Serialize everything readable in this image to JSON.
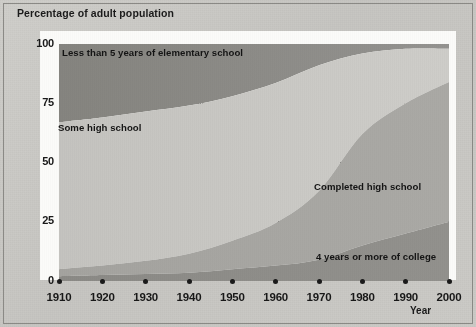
{
  "figure": {
    "y_axis_title": "Percentage of adult population",
    "x_axis_title": "Year"
  },
  "chart_data": {
    "type": "area",
    "title": "Percentage of adult population",
    "xlabel": "Year",
    "ylabel": "Percentage of adult population",
    "xlim": [
      1910,
      2000
    ],
    "ylim": [
      0,
      100
    ],
    "grid": true,
    "stacked": true,
    "legend": "inline-band-labels",
    "x": [
      1910,
      1920,
      1930,
      1940,
      1950,
      1960,
      1970,
      1980,
      1990,
      2000
    ],
    "y_ticks": [
      0,
      25,
      50,
      75,
      100
    ],
    "x_ticks": [
      1910,
      1920,
      1930,
      1940,
      1950,
      1960,
      1970,
      1980,
      1990,
      2000
    ],
    "series": [
      {
        "name": "4 years or more of college",
        "order": "bottom",
        "color": "#8e8d8a",
        "values": [
          2.0,
          2.5,
          3.0,
          3.5,
          5.0,
          6.5,
          9.0,
          15.0,
          20.0,
          25.0
        ]
      },
      {
        "name": "Completed high school",
        "order": "second",
        "color": "#a6a5a1",
        "values": [
          3.0,
          4.0,
          5.5,
          8.0,
          12.0,
          18.0,
          29.0,
          47.0,
          55.0,
          59.0
        ]
      },
      {
        "name": "Some high school",
        "order": "third",
        "color": "#c8c7c3",
        "values": [
          62.0,
          62.5,
          63.0,
          62.5,
          61.0,
          59.0,
          53.0,
          34.0,
          23.0,
          14.0
        ]
      },
      {
        "name": "Less than 5 years of elementary school",
        "order": "top",
        "color": "#8a8986",
        "values": [
          33.0,
          31.0,
          28.5,
          26.0,
          22.0,
          16.5,
          9.0,
          4.0,
          2.0,
          2.0
        ]
      }
    ],
    "cumulative_upper_bounds": {
      "college": [
        2.0,
        2.5,
        3.0,
        3.5,
        5.0,
        6.5,
        9.0,
        15.0,
        20.0,
        25.0
      ],
      "completed_high_school": [
        5.0,
        6.5,
        8.5,
        11.5,
        17.0,
        24.5,
        38.0,
        62.0,
        75.0,
        84.0
      ],
      "some_high_school": [
        67.0,
        69.0,
        71.5,
        74.0,
        78.0,
        83.5,
        91.0,
        96.0,
        98.0,
        98.0
      ],
      "less_than_5_years_elementary": [
        100,
        100,
        100,
        100,
        100,
        100,
        100,
        100,
        100,
        100
      ]
    },
    "annotations": [
      {
        "text": "Less than 5 years of elementary school",
        "x": 1910,
        "y": 96
      },
      {
        "text": "Some high school",
        "x": 1910,
        "y": 64
      },
      {
        "text": "Completed high school",
        "x": 1975,
        "y": 41
      },
      {
        "text": "4 years or more of college",
        "x": 1976,
        "y": 12
      }
    ]
  },
  "labels": {
    "elementary": "Less than 5 years of elementary school",
    "some_high_school": "Some high school",
    "completed_high_school": "Completed high school",
    "college": "4 years or more of college"
  },
  "y_ticks": [
    {
      "label": "100"
    },
    {
      "label": "75"
    },
    {
      "label": "50"
    },
    {
      "label": "25"
    },
    {
      "label": "0"
    }
  ],
  "x_ticks": [
    {
      "label": "1910"
    },
    {
      "label": "1920"
    },
    {
      "label": "1930"
    },
    {
      "label": "1940"
    },
    {
      "label": "1950"
    },
    {
      "label": "1960"
    },
    {
      "label": "1970"
    },
    {
      "label": "1980"
    },
    {
      "label": "1990"
    },
    {
      "label": "2000"
    }
  ],
  "colors": {
    "band_elementary": "#8a8986",
    "band_some_high_school": "#c8c7c3",
    "band_completed_high_school": "#a6a5a1",
    "band_college": "#8e8d8a",
    "page_background": "#c9c8c4",
    "plot_background": "#fbfbf9",
    "gridline": "#232323",
    "text": "#161616"
  }
}
